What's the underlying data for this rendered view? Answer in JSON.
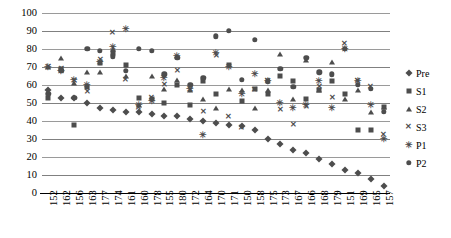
{
  "chart_data": {
    "type": "scatter",
    "title": "",
    "xlabel": "",
    "ylabel": "",
    "ylim": [
      0,
      100
    ],
    "ytick_step": 10,
    "yticks": [
      0,
      10,
      20,
      30,
      40,
      50,
      60,
      70,
      80,
      90,
      100
    ],
    "grid": true,
    "legend_position": "right",
    "categories": [
      "152",
      "162",
      "156",
      "163",
      "177",
      "174",
      "161",
      "160",
      "178",
      "155",
      "180",
      "172",
      "164",
      "170",
      "171",
      "150",
      "158",
      "175",
      "173",
      "167",
      "166",
      "168",
      "179",
      "151",
      "169",
      "165",
      "157"
    ],
    "series": [
      {
        "name": "Pre",
        "marker": "diamond",
        "color": "#4d4d4d",
        "values": [
          57,
          53,
          53,
          50,
          47,
          46,
          45,
          45,
          44,
          43,
          43,
          41,
          40,
          39,
          38,
          37,
          35,
          30,
          27,
          24,
          22,
          19,
          16,
          13,
          11,
          8,
          4
        ]
      },
      {
        "name": "S1",
        "marker": "square",
        "color": "#4d4d4d",
        "values": [
          53,
          69,
          38,
          59,
          72,
          78,
          71,
          53,
          52,
          50,
          60,
          49,
          62,
          55,
          71,
          51,
          58,
          55,
          65,
          62,
          52,
          57,
          62,
          55,
          35,
          35,
          48
        ]
      },
      {
        "name": "S2",
        "marker": "triangle",
        "color": "#4d4d4d",
        "values": [
          70,
          75,
          61,
          67,
          67,
          80,
          65,
          49,
          65,
          58,
          63,
          57,
          52,
          47,
          58,
          57,
          47,
          57,
          77,
          52,
          74,
          57,
          73,
          52,
          57,
          45,
          48
        ]
      },
      {
        "name": "S3",
        "marker": "x",
        "color": "#4d4d4d",
        "values": [
          70,
          69,
          62,
          56,
          74,
          89,
          63,
          47,
          53,
          60,
          68,
          57,
          45,
          76,
          42,
          36,
          57,
          62,
          46,
          38,
          48,
          59,
          53,
          83,
          62,
          59,
          32
        ]
      },
      {
        "name": "P1",
        "marker": "star",
        "color": "#4d4d4d",
        "values": [
          70,
          68,
          63,
          60,
          73,
          81,
          91,
          49,
          51,
          64,
          76,
          58,
          32,
          78,
          70,
          55,
          66,
          62,
          50,
          47,
          49,
          62,
          47,
          80,
          62,
          49,
          30
        ]
      },
      {
        "name": "P2",
        "marker": "circle",
        "color": "#4d4d4d",
        "values": [
          55,
          68,
          53,
          80,
          79,
          76,
          68,
          80,
          79,
          66,
          75,
          60,
          64,
          87,
          90,
          63,
          85,
          62,
          69,
          59,
          75,
          67,
          66,
          80,
          60,
          58,
          45
        ]
      }
    ]
  },
  "legend": {
    "items": [
      {
        "label": "Pre",
        "marker": "diamond"
      },
      {
        "label": "S1",
        "marker": "square"
      },
      {
        "label": "S2",
        "marker": "triangle"
      },
      {
        "label": "S3",
        "marker": "x"
      },
      {
        "label": "P1",
        "marker": "star"
      },
      {
        "label": "P2",
        "marker": "circle"
      }
    ]
  },
  "colors": {
    "marker": "#4d4d4d",
    "gridline": "#909090",
    "axis": "#000000",
    "background": "#ffffff"
  }
}
